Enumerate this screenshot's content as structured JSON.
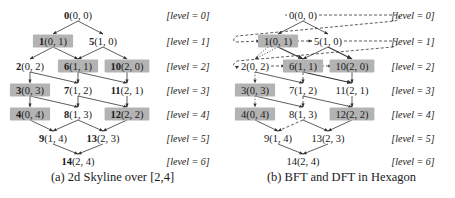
{
  "figure": {
    "panels": [
      {
        "id": "a",
        "caption": "(a) 2d Skyline over [2,4]",
        "offset_x": 0,
        "bold_ids": true
      },
      {
        "id": "b",
        "caption": "(b) BFT and DFT in Hexagon",
        "offset_x": 225,
        "bold_ids": false
      }
    ],
    "nodes": [
      {
        "id": "0",
        "coord": "(0,0)",
        "display_coord": "(0, 0)",
        "x": 78,
        "y": 15,
        "level": 0,
        "highlighted": false
      },
      {
        "id": "1",
        "coord": "(0,1)",
        "display_coord": "(0, 1)",
        "x": 53,
        "y": 41,
        "level": 1,
        "highlighted": true
      },
      {
        "id": "5",
        "coord": "(1,0)",
        "display_coord": "(1, 0)",
        "x": 103,
        "y": 41,
        "level": 1,
        "highlighted": false
      },
      {
        "id": "2",
        "coord": "(0,2)",
        "display_coord": "(0, 2)",
        "x": 30,
        "y": 66,
        "level": 2,
        "highlighted": false
      },
      {
        "id": "6",
        "coord": "(1,1)",
        "display_coord": "(1, 1)",
        "x": 78,
        "y": 66,
        "level": 2,
        "highlighted": true
      },
      {
        "id": "10",
        "coord": "(2,0)",
        "display_coord": "(2, 0)",
        "x": 127,
        "y": 66,
        "level": 2,
        "highlighted": true
      },
      {
        "id": "3",
        "coord": "(0,3)",
        "display_coord": "(0, 3)",
        "x": 30,
        "y": 90,
        "level": 3,
        "highlighted": true
      },
      {
        "id": "7",
        "coord": "(1,2)",
        "display_coord": "(1, 2)",
        "x": 78,
        "y": 90,
        "level": 3,
        "highlighted": false
      },
      {
        "id": "11",
        "coord": "(2,1)",
        "display_coord": "(2, 1)",
        "x": 127,
        "y": 90,
        "level": 3,
        "highlighted": false
      },
      {
        "id": "4",
        "coord": "(0,4)",
        "display_coord": "(0, 4)",
        "x": 30,
        "y": 114,
        "level": 4,
        "highlighted": true
      },
      {
        "id": "8",
        "coord": "(1,3)",
        "display_coord": "(1, 3)",
        "x": 78,
        "y": 114,
        "level": 4,
        "highlighted": false
      },
      {
        "id": "12",
        "coord": "(2,2)",
        "display_coord": "(2, 2)",
        "x": 127,
        "y": 114,
        "level": 4,
        "highlighted": true
      },
      {
        "id": "9",
        "coord": "(1,4)",
        "display_coord": "(1, 4)",
        "x": 53,
        "y": 138,
        "level": 5,
        "highlighted": false
      },
      {
        "id": "13",
        "coord": "(2,3)",
        "display_coord": "(2, 3)",
        "x": 103,
        "y": 138,
        "level": 5,
        "highlighted": false
      },
      {
        "id": "14",
        "coord": "(2,4)",
        "display_coord": "(2, 4)",
        "x": 78,
        "y": 161,
        "level": 6,
        "highlighted": false
      }
    ],
    "edges": [
      [
        "0",
        "1"
      ],
      [
        "0",
        "5"
      ],
      [
        "1",
        "2"
      ],
      [
        "1",
        "6"
      ],
      [
        "5",
        "6"
      ],
      [
        "5",
        "10"
      ],
      [
        "2",
        "3"
      ],
      [
        "2",
        "7"
      ],
      [
        "6",
        "7"
      ],
      [
        "6",
        "11"
      ],
      [
        "10",
        "11"
      ],
      [
        "3",
        "4"
      ],
      [
        "3",
        "8"
      ],
      [
        "7",
        "8"
      ],
      [
        "7",
        "12"
      ],
      [
        "11",
        "12"
      ],
      [
        "4",
        "9"
      ],
      [
        "8",
        "9"
      ],
      [
        "8",
        "13"
      ],
      [
        "12",
        "13"
      ],
      [
        "9",
        "14"
      ],
      [
        "13",
        "14"
      ]
    ],
    "levels": [
      {
        "label": "[level = 0]",
        "y": 15
      },
      {
        "label": "[level = 1]",
        "y": 41
      },
      {
        "label": "[level = 2]",
        "y": 66
      },
      {
        "label": "[level = 3]",
        "y": 90
      },
      {
        "label": "[level = 4]",
        "y": 114
      },
      {
        "label": "[level = 5]",
        "y": 138
      },
      {
        "label": "[level = 6]",
        "y": 161
      }
    ],
    "level_label_x": 188,
    "bft_path": [
      "0",
      "1",
      "5",
      "2",
      "6",
      "10"
    ],
    "dft_dotted_edges": [
      [
        "1",
        "2"
      ],
      [
        "2",
        "3"
      ],
      [
        "3",
        "4"
      ]
    ],
    "dft_dashed_edges": [
      [
        "6",
        "7"
      ],
      [
        "7",
        "8"
      ],
      [
        "8",
        "9"
      ]
    ],
    "colors": {
      "highlight_fill": "#b3b3b3",
      "edge": "#333333",
      "text": "#1a1a1a",
      "background": "#ffffff"
    }
  }
}
